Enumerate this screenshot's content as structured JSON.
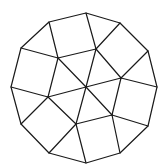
{
  "diagram": {
    "stroke_color": "#1a1a1a",
    "background": "#ffffff",
    "outer": [
      [
        86,
        13
      ],
      [
        120,
        23
      ],
      [
        148,
        51
      ],
      [
        157,
        87
      ],
      [
        148,
        126
      ],
      [
        120,
        153
      ],
      [
        86,
        163
      ],
      [
        49,
        153
      ],
      [
        21,
        124
      ],
      [
        11,
        87
      ],
      [
        21,
        48
      ],
      [
        49,
        22
      ]
    ],
    "inner_points": {
      "a": [
        58,
        58
      ],
      "b": [
        96,
        49
      ],
      "c": [
        86,
        87
      ],
      "d": [
        121,
        78
      ],
      "e": [
        48,
        97
      ],
      "f": [
        112,
        115
      ],
      "g": [
        76,
        124
      ]
    },
    "edges": [
      [
        [
          49,
          22
        ],
        [
          58,
          58
        ]
      ],
      [
        [
          21,
          48
        ],
        [
          58,
          58
        ]
      ],
      [
        [
          58,
          58
        ],
        [
          96,
          49
        ]
      ],
      [
        [
          86,
          13
        ],
        [
          96,
          49
        ]
      ],
      [
        [
          96,
          49
        ],
        [
          120,
          23
        ]
      ],
      [
        [
          96,
          49
        ],
        [
          86,
          87
        ]
      ],
      [
        [
          58,
          58
        ],
        [
          86,
          87
        ]
      ],
      [
        [
          58,
          58
        ],
        [
          48,
          97
        ]
      ],
      [
        [
          11,
          87
        ],
        [
          48,
          97
        ]
      ],
      [
        [
          48,
          97
        ],
        [
          86,
          87
        ]
      ],
      [
        [
          86,
          87
        ],
        [
          121,
          78
        ]
      ],
      [
        [
          96,
          49
        ],
        [
          121,
          78
        ]
      ],
      [
        [
          121,
          78
        ],
        [
          148,
          51
        ]
      ],
      [
        [
          121,
          78
        ],
        [
          157,
          87
        ]
      ],
      [
        [
          121,
          78
        ],
        [
          112,
          115
        ]
      ],
      [
        [
          86,
          87
        ],
        [
          112,
          115
        ]
      ],
      [
        [
          86,
          87
        ],
        [
          76,
          124
        ]
      ],
      [
        [
          48,
          97
        ],
        [
          76,
          124
        ]
      ],
      [
        [
          48,
          97
        ],
        [
          21,
          124
        ]
      ],
      [
        [
          76,
          124
        ],
        [
          112,
          115
        ]
      ],
      [
        [
          112,
          115
        ],
        [
          148,
          126
        ]
      ],
      [
        [
          76,
          124
        ],
        [
          49,
          153
        ]
      ],
      [
        [
          76,
          124
        ],
        [
          86,
          163
        ]
      ],
      [
        [
          112,
          115
        ],
        [
          120,
          153
        ]
      ]
    ]
  }
}
